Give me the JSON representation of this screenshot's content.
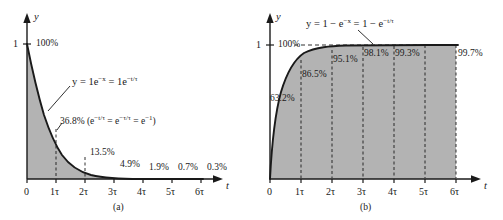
{
  "figure": {
    "panels": [
      {
        "id": "a",
        "caption": "(a)",
        "equation_html": "y = 1e<sup>&#8722;x</sup> = 1e<sup>&#8722;t/&#964;</sup>",
        "equation_text": "y = 1e^(-x) = 1e^(-t/tau)",
        "y_axis_label": "y",
        "x_axis_label": "t",
        "y_tick_label": "1",
        "top_percent": "100%",
        "tau_annotation_html": "36.8% (e<sup>&#8722;t/&#964;</sup> = e<sup>&#8722;&#964;/&#964;</sup> = e<sup>&#8722;1</sup>)",
        "tau_annotation_text": "36.8% (e^(-t/tau) = e^(-tau/tau) = e^(-1))",
        "x_ticks": [
          "0",
          "1τ",
          "2τ",
          "3τ",
          "4τ",
          "5τ",
          "6τ"
        ],
        "point_percents": [
          "100%",
          "36.8%",
          "13.5%",
          "4.9%",
          "1.9%",
          "0.7%",
          "0.3%"
        ]
      },
      {
        "id": "b",
        "caption": "(b)",
        "equation_html": "y = 1 &#8722; e<sup>&#8722;x</sup> = 1 &#8722; e<sup>&#8722;t/&#964;</sup>",
        "equation_text": "y = 1 - e^(-x) = 1 - e^(-t/tau)",
        "y_axis_label": "y",
        "x_axis_label": "t",
        "y_tick_label": "1",
        "top_percent": "100%",
        "x_ticks": [
          "0",
          "1τ",
          "2τ",
          "3τ",
          "4τ",
          "5τ",
          "6τ"
        ],
        "point_percents": [
          "63.2%",
          "86.5%",
          "95.1%",
          "98.1%",
          "99.3%",
          "99.7%"
        ]
      }
    ]
  },
  "chart_data": [
    {
      "type": "line",
      "title": "",
      "panel": "(a)",
      "equation": "y = 1e^(-x) = 1e^(-t/tau)",
      "xlabel": "t",
      "ylabel": "y",
      "x": [
        0,
        1,
        2,
        3,
        4,
        5,
        6
      ],
      "xtick_labels": [
        "0",
        "1τ",
        "2τ",
        "3τ",
        "4τ",
        "5τ",
        "6τ"
      ],
      "ytick_labels": [
        "1"
      ],
      "ytick_values": [
        1
      ],
      "values": [
        1.0,
        0.368,
        0.135,
        0.049,
        0.019,
        0.007,
        0.003
      ],
      "value_labels": [
        "100%",
        "36.8%",
        "13.5%",
        "4.9%",
        "1.9%",
        "0.7%",
        "0.3%"
      ],
      "xlim": [
        0,
        6.5
      ],
      "ylim": [
        0,
        1.12
      ],
      "grid": false,
      "legend": "none",
      "fill": "area under curve, gray",
      "annotations": [
        "100%",
        "y = 1e^(-x) = 1e^(-t/tau)",
        "36.8% (e^(-t/tau) = e^(-tau/tau) = e^(-1))",
        "13.5%",
        "4.9%",
        "1.9%",
        "0.7%",
        "0.3%"
      ],
      "dashed_verticals_at": [
        1,
        2
      ]
    },
    {
      "type": "line",
      "title": "",
      "panel": "(b)",
      "equation": "y = 1 - e^(-x) = 1 - e^(-t/tau)",
      "xlabel": "t",
      "ylabel": "y",
      "x": [
        0,
        1,
        2,
        3,
        4,
        5,
        6
      ],
      "xtick_labels": [
        "0",
        "1τ",
        "2τ",
        "3τ",
        "4τ",
        "5τ",
        "6τ"
      ],
      "ytick_labels": [
        "1"
      ],
      "ytick_values": [
        1
      ],
      "values": [
        0.0,
        0.632,
        0.865,
        0.951,
        0.981,
        0.993,
        0.997
      ],
      "value_labels": [
        "",
        "63.2%",
        "86.5%",
        "95.1%",
        "98.1%",
        "99.3%",
        "99.7%"
      ],
      "xlim": [
        0,
        6.5
      ],
      "ylim": [
        0,
        1.12
      ],
      "grid": false,
      "legend": "none",
      "fill": "area under curve, gray",
      "annotations": [
        "100%",
        "y = 1 - e^(-x) = 1 - e^(-t/tau)",
        "63.2%",
        "86.5%",
        "95.1%",
        "98.1%",
        "99.3%",
        "99.7%"
      ],
      "dashed_verticals_at": [
        1,
        2,
        3,
        4,
        5,
        6
      ],
      "dashed_horizontal_at": 1.0
    }
  ],
  "style": {
    "fill_color": "#b3b3b3",
    "curve_color": "#1a1a1a",
    "axis_color": "#1a1a1a",
    "background": "#ffffff"
  }
}
